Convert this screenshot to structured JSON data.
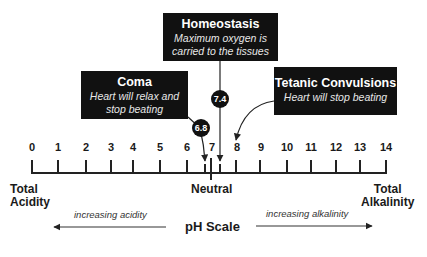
{
  "title": "pH Scale",
  "scale": {
    "ticks": [
      "0",
      "1",
      "2",
      "3",
      "4",
      "5",
      "6",
      "7",
      "8",
      "9",
      "10",
      "11",
      "12",
      "13",
      "14"
    ],
    "left_end": {
      "line1": "Total",
      "line2": "Acidity"
    },
    "center": "Neutral",
    "right_end": {
      "line1": "Total",
      "line2": "Alkalinity"
    }
  },
  "callouts": {
    "homeostasis": {
      "title": "Homeostasis",
      "line1": "Maximum oxygen is",
      "line2": "carried to the tissues",
      "value": "7.4"
    },
    "coma": {
      "title": "Coma",
      "line1": "Heart will relax and",
      "line2": "stop beating",
      "value": "6.8"
    },
    "tetanic": {
      "title": "Tetanic Convulsions",
      "line1": "Heart will stop beating",
      "value": "8"
    }
  },
  "arrows": {
    "left": "increasing acidity",
    "right": "increasing alkalinity"
  },
  "colors": {
    "box": "#111111",
    "text": "#1a1a1a",
    "line": "#222222"
  }
}
